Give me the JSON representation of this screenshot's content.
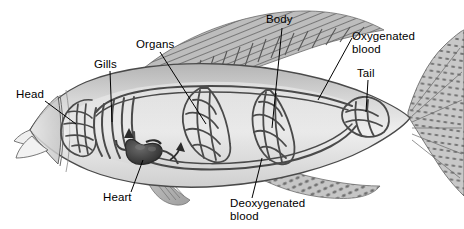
{
  "diagram": {
    "background_color": "#ffffff",
    "ink_color": "#000000",
    "vessel_color": "#4a4a4a",
    "body_fill": "#e8e8e8",
    "fin_fill": "#b8b8b8",
    "heart_color": "#3a3a3a"
  },
  "labels": {
    "head": "Head",
    "gills": "Gills",
    "organs": "Organs",
    "body": "Body",
    "oxygenated_line1": "Oxygenated",
    "oxygenated_line2": "blood",
    "tail": "Tail",
    "heart": "Heart",
    "deoxygenated_line1": "Deoxygenated",
    "deoxygenated_line2": "blood"
  },
  "parts": [
    {
      "name": "head",
      "label": "Head",
      "x": 18,
      "y": 93
    },
    {
      "name": "gills",
      "label": "Gills",
      "x": 95,
      "y": 63
    },
    {
      "name": "organs",
      "label": "Organs",
      "x": 137,
      "y": 43
    },
    {
      "name": "body",
      "label": "Body",
      "x": 268,
      "y": 18
    },
    {
      "name": "oxygenated-blood",
      "label": "Oxygenated blood",
      "x": 352,
      "y": 35
    },
    {
      "name": "tail",
      "label": "Tail",
      "x": 358,
      "y": 72
    },
    {
      "name": "heart",
      "label": "Heart",
      "x": 104,
      "y": 196
    },
    {
      "name": "deoxygenated-blood",
      "label": "Deoxygenated blood",
      "x": 231,
      "y": 202
    }
  ],
  "capillary_beds": [
    {
      "name": "head-capillary-bed",
      "cx": 78,
      "cy": 124
    },
    {
      "name": "gill-capillary-bed",
      "cx": 112,
      "cy": 120
    },
    {
      "name": "organs-capillary-bed",
      "cx": 208,
      "cy": 124
    },
    {
      "name": "body-capillary-bed",
      "cx": 272,
      "cy": 128
    },
    {
      "name": "tail-capillary-bed",
      "cx": 364,
      "cy": 112
    }
  ],
  "flow_arrows": [
    {
      "name": "arrow-to-gills",
      "x": 130,
      "y": 133,
      "direction": "up"
    },
    {
      "name": "arrow-from-heart",
      "x": 175,
      "y": 152,
      "direction": "up-right"
    }
  ]
}
